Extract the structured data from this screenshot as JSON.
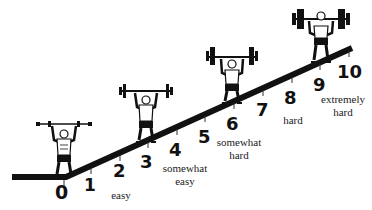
{
  "diagram": {
    "type": "effort-scale-ramp",
    "colors": {
      "ink": "#111111",
      "background": "#ffffff"
    },
    "scale": [
      {
        "value": "0",
        "label": ""
      },
      {
        "value": "1",
        "label": ""
      },
      {
        "value": "2",
        "label": "easy"
      },
      {
        "value": "3",
        "label": ""
      },
      {
        "value": "4",
        "label": "somewhat easy"
      },
      {
        "value": "5",
        "label": ""
      },
      {
        "value": "6",
        "label": "somewhat hard"
      },
      {
        "value": "7",
        "label": ""
      },
      {
        "value": "8",
        "label": "hard"
      },
      {
        "value": "9",
        "label": ""
      },
      {
        "value": "10",
        "label": "extremely hard"
      }
    ],
    "labels": {
      "easy": "easy",
      "somewhat_easy_1": "somewhat",
      "somewhat_easy_2": "easy",
      "somewhat_hard_1": "somewhat",
      "somewhat_hard_2": "hard",
      "hard": "hard",
      "extremely_hard_1": "extremely",
      "extremely_hard_2": "hard"
    },
    "figures": [
      {
        "name": "weightlifter-light",
        "weight": "light barbell",
        "position": "0"
      },
      {
        "name": "weightlifter-moderate",
        "weight": "medium barbell",
        "position": "3"
      },
      {
        "name": "weightlifter-heavy",
        "weight": "heavy barbell",
        "position": "6"
      },
      {
        "name": "weightlifter-max",
        "weight": "very heavy barbell",
        "position": "9-10"
      }
    ]
  }
}
